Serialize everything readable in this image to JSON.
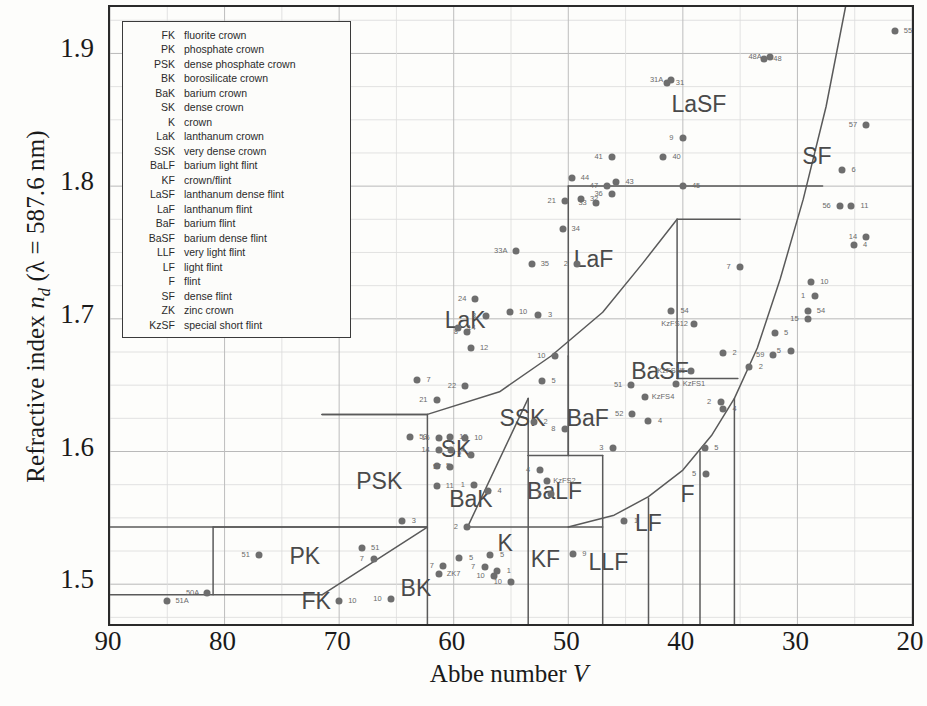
{
  "axes": {
    "xlabel_text": "Abbe number ",
    "xlabel_italic": "V",
    "ylabel_prefix": "Refractive index ",
    "ylabel_n": "n",
    "ylabel_sub": "d",
    "ylabel_suffix": "  (λ = 587.6 nm)",
    "xticks": [
      "90",
      "80",
      "70",
      "60",
      "50",
      "40",
      "30",
      "20"
    ],
    "yticks": [
      "1.9",
      "1.8",
      "1.7",
      "1.6",
      "1.5"
    ]
  },
  "legend": {
    "rows": [
      {
        "abbr": "FK",
        "desc": "fluorite crown"
      },
      {
        "abbr": "PK",
        "desc": "phosphate crown"
      },
      {
        "abbr": "PSK",
        "desc": "dense phosphate crown"
      },
      {
        "abbr": "BK",
        "desc": "borosilicate crown"
      },
      {
        "abbr": "BaK",
        "desc": "barium crown"
      },
      {
        "abbr": "SK",
        "desc": "dense crown"
      },
      {
        "abbr": "K",
        "desc": "crown"
      },
      {
        "abbr": "LaK",
        "desc": "lanthanum crown"
      },
      {
        "abbr": "SSK",
        "desc": "very dense crown"
      },
      {
        "abbr": "BaLF",
        "desc": "barium light flint"
      },
      {
        "abbr": "KF",
        "desc": "crown/flint"
      },
      {
        "abbr": "LaSF",
        "desc": "lanthanum dense flint"
      },
      {
        "abbr": "LaF",
        "desc": "lanthanum flint"
      },
      {
        "abbr": "BaF",
        "desc": "barium flint"
      },
      {
        "abbr": "BaSF",
        "desc": "barium dense flint"
      },
      {
        "abbr": "LLF",
        "desc": "very light flint"
      },
      {
        "abbr": "LF",
        "desc": "light flint"
      },
      {
        "abbr": "F",
        "desc": "flint"
      },
      {
        "abbr": "SF",
        "desc": "dense flint"
      },
      {
        "abbr": "ZK",
        "desc": "zinc crown"
      },
      {
        "abbr": "KzSF",
        "desc": "special short flint"
      }
    ]
  },
  "chart_data": {
    "type": "scatter",
    "title": "",
    "xlabel": "Abbe number V",
    "ylabel": "Refractive index n_d (lambda = 587.6 nm)",
    "xlim": [
      90,
      20
    ],
    "ylim": [
      1.47,
      1.935
    ],
    "x_reversed": true,
    "grid": true,
    "xticks": [
      90,
      80,
      70,
      60,
      50,
      40,
      30,
      20
    ],
    "yticks": [
      1.5,
      1.6,
      1.7,
      1.8,
      1.9
    ],
    "minor_y_step": 0.025,
    "legend_position": "top-left-inset",
    "colors": {
      "point": "#6e6e6e",
      "boundary": "#5a5a5a",
      "grid": "#cfcfcf",
      "axis": "#2a2a2a",
      "label": "#4a4a4a"
    },
    "region_labels": [
      {
        "name": "FK",
        "v": 72.0,
        "n": 1.487,
        "size": 23
      },
      {
        "name": "PK",
        "v": 73.0,
        "n": 1.521,
        "size": 23
      },
      {
        "name": "PSK",
        "v": 66.5,
        "n": 1.578,
        "size": 23
      },
      {
        "name": "BK",
        "v": 63.3,
        "n": 1.497,
        "size": 23
      },
      {
        "name": "BaK",
        "v": 58.5,
        "n": 1.564,
        "size": 23
      },
      {
        "name": "K",
        "v": 55.5,
        "n": 1.531,
        "size": 23
      },
      {
        "name": "SK",
        "v": 59.8,
        "n": 1.602,
        "size": 23
      },
      {
        "name": "SSK",
        "v": 54.0,
        "n": 1.625,
        "size": 23
      },
      {
        "name": "LaK",
        "v": 59.0,
        "n": 1.699,
        "size": 23
      },
      {
        "name": "BaLF",
        "v": 51.2,
        "n": 1.57,
        "size": 23
      },
      {
        "name": "KF",
        "v": 52.0,
        "n": 1.519,
        "size": 23
      },
      {
        "name": "LLF",
        "v": 46.5,
        "n": 1.517,
        "size": 23
      },
      {
        "name": "LF",
        "v": 43.0,
        "n": 1.546,
        "size": 23
      },
      {
        "name": "F",
        "v": 39.6,
        "n": 1.568,
        "size": 23
      },
      {
        "name": "BaF",
        "v": 48.3,
        "n": 1.625,
        "size": 23
      },
      {
        "name": "BaSF",
        "v": 42.0,
        "n": 1.661,
        "size": 23
      },
      {
        "name": "LaF",
        "v": 47.8,
        "n": 1.745,
        "size": 23
      },
      {
        "name": "LaSF",
        "v": 38.6,
        "n": 1.862,
        "size": 23
      },
      {
        "name": "SF",
        "v": 28.3,
        "n": 1.823,
        "size": 23
      }
    ],
    "boundaries": [
      {
        "id": "fk-top",
        "points": [
          [
            90,
            1.492
          ],
          [
            71.5,
            1.492
          ]
        ]
      },
      {
        "id": "fk-bk-slope",
        "points": [
          [
            71.5,
            1.492
          ],
          [
            62.3,
            1.543
          ]
        ]
      },
      {
        "id": "pk-top",
        "points": [
          [
            81.0,
            1.543
          ],
          [
            62.3,
            1.543
          ]
        ]
      },
      {
        "id": "pk-left",
        "points": [
          [
            81.0,
            1.543
          ],
          [
            81.0,
            1.492
          ]
        ]
      },
      {
        "id": "psk-top",
        "points": [
          [
            71.5,
            1.628
          ],
          [
            62.3,
            1.628
          ]
        ]
      },
      {
        "id": "psk-bottom",
        "points": [
          [
            90,
            1.543
          ],
          [
            62.3,
            1.543
          ]
        ]
      },
      {
        "id": "psk-right",
        "points": [
          [
            62.3,
            1.628
          ],
          [
            62.3,
            1.466
          ]
        ]
      },
      {
        "id": "psk-upper",
        "points": [
          [
            71.5,
            1.628
          ],
          [
            62.3,
            1.628
          ]
        ]
      },
      {
        "id": "sk-lak-line",
        "points": [
          [
            62.3,
            1.628
          ],
          [
            56.0,
            1.645
          ],
          [
            51.5,
            1.672
          ],
          [
            47.0,
            1.705
          ],
          [
            43.5,
            1.742
          ],
          [
            40.5,
            1.775
          ]
        ]
      },
      {
        "id": "sk-bak-diag",
        "points": [
          [
            58.8,
            1.543
          ],
          [
            53.5,
            1.64
          ]
        ]
      },
      {
        "id": "ssk-left",
        "points": [
          [
            53.5,
            1.64
          ],
          [
            53.5,
            1.597
          ]
        ]
      },
      {
        "id": "ssk-right",
        "points": [
          [
            50.0,
            1.672
          ],
          [
            50.0,
            1.597
          ]
        ]
      },
      {
        "id": "bak-bottom",
        "points": [
          [
            58.8,
            1.543
          ],
          [
            47.0,
            1.543
          ]
        ]
      },
      {
        "id": "balf-left",
        "points": [
          [
            53.5,
            1.597
          ],
          [
            47.0,
            1.597
          ]
        ]
      },
      {
        "id": "k-right",
        "points": [
          [
            53.5,
            1.597
          ],
          [
            53.5,
            1.466
          ]
        ]
      },
      {
        "id": "kf-right",
        "points": [
          [
            47.0,
            1.597
          ],
          [
            47.0,
            1.466
          ]
        ]
      },
      {
        "id": "llf-right",
        "points": [
          [
            43.0,
            1.565
          ],
          [
            43.0,
            1.466
          ]
        ]
      },
      {
        "id": "lf-right",
        "points": [
          [
            38.5,
            1.6
          ],
          [
            38.5,
            1.466
          ]
        ]
      },
      {
        "id": "f-right",
        "points": [
          [
            35.5,
            1.64
          ],
          [
            35.5,
            1.466
          ]
        ]
      },
      {
        "id": "flint-curve",
        "points": [
          [
            50.0,
            1.543
          ],
          [
            46.0,
            1.552
          ],
          [
            43.0,
            1.566
          ],
          [
            40.0,
            1.586
          ],
          [
            37.5,
            1.612
          ],
          [
            35.5,
            1.64
          ],
          [
            33.5,
            1.678
          ],
          [
            31.5,
            1.73
          ],
          [
            29.5,
            1.79
          ],
          [
            27.5,
            1.86
          ],
          [
            25.8,
            1.935
          ]
        ]
      },
      {
        "id": "basf-left",
        "points": [
          [
            40.5,
            1.775
          ],
          [
            40.5,
            1.655
          ]
        ]
      },
      {
        "id": "basf-top",
        "points": [
          [
            40.5,
            1.775
          ],
          [
            35.0,
            1.775
          ]
        ]
      },
      {
        "id": "basf-bottom",
        "points": [
          [
            40.5,
            1.655
          ],
          [
            35.2,
            1.655
          ]
        ]
      },
      {
        "id": "baf-left",
        "points": [
          [
            50.0,
            1.672
          ],
          [
            50.0,
            1.597
          ]
        ]
      },
      {
        "id": "laf-left",
        "points": [
          [
            50.0,
            1.8
          ],
          [
            50.0,
            1.672
          ]
        ]
      },
      {
        "id": "lasf-base",
        "points": [
          [
            50.0,
            1.8
          ],
          [
            27.8,
            1.8
          ]
        ]
      }
    ],
    "points": [
      {
        "label": "51A",
        "v": 85.0,
        "n": 1.487
      },
      {
        "label": "50A",
        "v": 81.5,
        "n": 1.493
      },
      {
        "label": "3",
        "v": 64.5,
        "n": 1.548
      },
      {
        "label": "51",
        "v": 77.0,
        "n": 1.522
      },
      {
        "label": "51",
        "v": 68.0,
        "n": 1.527
      },
      {
        "label": "7",
        "v": 67.0,
        "n": 1.519
      },
      {
        "label": "10",
        "v": 70.0,
        "n": 1.487
      },
      {
        "label": "10",
        "v": 65.5,
        "n": 1.489
      },
      {
        "label": "53",
        "v": 63.8,
        "n": 1.611
      },
      {
        "label": "21",
        "v": 61.5,
        "n": 1.639
      },
      {
        "label": "7",
        "v": 63.2,
        "n": 1.654
      },
      {
        "label": "22",
        "v": 59.0,
        "n": 1.649
      },
      {
        "label": "15",
        "v": 60.3,
        "n": 1.611
      },
      {
        "label": "16",
        "v": 61.3,
        "n": 1.61
      },
      {
        "label": "10",
        "v": 59.0,
        "n": 1.61
      },
      {
        "label": "14",
        "v": 61.3,
        "n": 1.601
      },
      {
        "label": "4",
        "v": 60.2,
        "n": 1.601
      },
      {
        "label": "2",
        "v": 58.5,
        "n": 1.597
      },
      {
        "label": "5",
        "v": 61.5,
        "n": 1.589
      },
      {
        "label": "57",
        "v": 60.3,
        "n": 1.588
      },
      {
        "label": "11",
        "v": 61.5,
        "n": 1.574
      },
      {
        "label": "1",
        "v": 58.2,
        "n": 1.575
      },
      {
        "label": "4",
        "v": 57.0,
        "n": 1.57
      },
      {
        "label": "2",
        "v": 58.8,
        "n": 1.543
      },
      {
        "label": "5",
        "v": 59.5,
        "n": 1.52
      },
      {
        "label": "7",
        "v": 60.9,
        "n": 1.514
      },
      {
        "label": "ZK7",
        "v": 61.3,
        "n": 1.508
      },
      {
        "label": "10",
        "v": 56.5,
        "n": 1.506
      },
      {
        "label": "2",
        "v": 53.0,
        "n": 1.622
      },
      {
        "label": "8",
        "v": 50.3,
        "n": 1.617
      },
      {
        "label": "5",
        "v": 52.3,
        "n": 1.653
      },
      {
        "label": "10",
        "v": 51.2,
        "n": 1.672
      },
      {
        "label": "12",
        "v": 58.5,
        "n": 1.678
      },
      {
        "label": "8",
        "v": 58.8,
        "n": 1.69
      },
      {
        "label": "14",
        "v": 59.6,
        "n": 1.693
      },
      {
        "label": "8",
        "v": 57.2,
        "n": 1.702
      },
      {
        "label": "10",
        "v": 55.1,
        "n": 1.705
      },
      {
        "label": "24",
        "v": 58.1,
        "n": 1.715
      },
      {
        "label": "3",
        "v": 52.6,
        "n": 1.703
      },
      {
        "label": "33A",
        "v": 54.6,
        "n": 1.751
      },
      {
        "label": "35",
        "v": 53.2,
        "n": 1.741
      },
      {
        "label": "2",
        "v": 49.2,
        "n": 1.741
      },
      {
        "label": "34",
        "v": 50.5,
        "n": 1.768
      },
      {
        "label": "21",
        "v": 50.3,
        "n": 1.789
      },
      {
        "label": "32",
        "v": 48.9,
        "n": 1.79
      },
      {
        "label": "33",
        "v": 47.6,
        "n": 1.787
      },
      {
        "label": "44",
        "v": 49.7,
        "n": 1.806
      },
      {
        "label": "47",
        "v": 46.6,
        "n": 1.8
      },
      {
        "label": "43",
        "v": 45.8,
        "n": 1.803
      },
      {
        "label": "36",
        "v": 46.2,
        "n": 1.794
      },
      {
        "label": "45",
        "v": 40.0,
        "n": 1.8
      },
      {
        "label": "41",
        "v": 46.2,
        "n": 1.822
      },
      {
        "label": "40",
        "v": 41.7,
        "n": 1.822
      },
      {
        "label": "9",
        "v": 40.0,
        "n": 1.836
      },
      {
        "label": "31",
        "v": 41.4,
        "n": 1.878
      },
      {
        "label": "31A",
        "v": 41.0,
        "n": 1.88
      },
      {
        "label": "48",
        "v": 32.9,
        "n": 1.896
      },
      {
        "label": "48A",
        "v": 32.4,
        "n": 1.897
      },
      {
        "label": "55",
        "v": 21.5,
        "n": 1.917
      },
      {
        "label": "57",
        "v": 24.0,
        "n": 1.846
      },
      {
        "label": "6",
        "v": 26.1,
        "n": 1.812
      },
      {
        "label": "56",
        "v": 26.3,
        "n": 1.785
      },
      {
        "label": "11",
        "v": 25.3,
        "n": 1.785
      },
      {
        "label": "14",
        "v": 24.0,
        "n": 1.762
      },
      {
        "label": "4",
        "v": 25.1,
        "n": 1.756
      },
      {
        "label": "7",
        "v": 35.0,
        "n": 1.739
      },
      {
        "label": "10",
        "v": 28.8,
        "n": 1.728
      },
      {
        "label": "1",
        "v": 28.5,
        "n": 1.717
      },
      {
        "label": "54",
        "v": 29.1,
        "n": 1.706
      },
      {
        "label": "15",
        "v": 29.1,
        "n": 1.7
      },
      {
        "label": "54",
        "v": 41.0,
        "n": 1.706
      },
      {
        "label": "KzFS12",
        "v": 39.0,
        "n": 1.696
      },
      {
        "label": "5",
        "v": 32.0,
        "n": 1.689
      },
      {
        "label": "5",
        "v": 30.6,
        "n": 1.676
      },
      {
        "label": "2",
        "v": 36.5,
        "n": 1.674
      },
      {
        "label": "59",
        "v": 32.1,
        "n": 1.673
      },
      {
        "label": "2",
        "v": 34.2,
        "n": 1.664
      },
      {
        "label": "KzFSN5",
        "v": 39.3,
        "n": 1.661
      },
      {
        "label": "KzFS1",
        "v": 40.6,
        "n": 1.651
      },
      {
        "label": "2",
        "v": 36.7,
        "n": 1.637
      },
      {
        "label": "4",
        "v": 36.5,
        "n": 1.632
      },
      {
        "label": "51",
        "v": 44.5,
        "n": 1.65
      },
      {
        "label": "KzFS4",
        "v": 43.3,
        "n": 1.641
      },
      {
        "label": "52",
        "v": 44.4,
        "n": 1.628
      },
      {
        "label": "4",
        "v": 43.0,
        "n": 1.623
      },
      {
        "label": "3",
        "v": 46.1,
        "n": 1.603
      },
      {
        "label": "5",
        "v": 38.1,
        "n": 1.603
      },
      {
        "label": "5",
        "v": 38.0,
        "n": 1.583
      },
      {
        "label": "1",
        "v": 45.1,
        "n": 1.548
      },
      {
        "label": "4",
        "v": 52.5,
        "n": 1.586
      },
      {
        "label": "KzFS2",
        "v": 51.9,
        "n": 1.578
      },
      {
        "label": "5",
        "v": 51.5,
        "n": 1.568
      },
      {
        "label": "9",
        "v": 49.6,
        "n": 1.523
      },
      {
        "label": "10",
        "v": 55.0,
        "n": 1.502
      },
      {
        "label": "5",
        "v": 56.8,
        "n": 1.522
      },
      {
        "label": "7",
        "v": 57.3,
        "n": 1.513
      },
      {
        "label": "1",
        "v": 56.2,
        "n": 1.51
      }
    ]
  }
}
